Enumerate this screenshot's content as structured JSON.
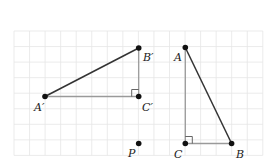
{
  "diagram": {
    "type": "geometry-grid",
    "grid": {
      "x0": 14,
      "y0": 31,
      "cell": 15.55,
      "cols": 16,
      "rows": 8,
      "color": "#e6e6e6"
    },
    "colors": {
      "leg": "#9a9a9a",
      "hypotenuse": "#333333",
      "point": "#111111",
      "right_angle": "#555555"
    },
    "points": {
      "A_prime": {
        "label": "A′",
        "x": 45,
        "y": 96.5,
        "lx": 34,
        "ly": 111
      },
      "B_prime": {
        "label": "B′",
        "x": 138.7,
        "y": 48,
        "lx": 143,
        "ly": 61
      },
      "C_prime": {
        "label": "C′",
        "x": 138.7,
        "y": 96.5,
        "lx": 142,
        "ly": 111
      },
      "P": {
        "label": "P",
        "x": 138.7,
        "y": 143.5,
        "lx": 128,
        "ly": 157
      },
      "A": {
        "label": "A",
        "x": 185.3,
        "y": 47.5,
        "lx": 174,
        "ly": 61
      },
      "B": {
        "label": "B",
        "x": 231.6,
        "y": 143.5,
        "lx": 236,
        "ly": 158
      },
      "C": {
        "label": "C",
        "x": 185.3,
        "y": 143.5,
        "lx": 174,
        "ly": 158
      }
    },
    "triangles": [
      {
        "name": "A'B'C'",
        "vertices": [
          "A′",
          "B′",
          "C′"
        ],
        "right_angle_at": "C′"
      },
      {
        "name": "ABC",
        "vertices": [
          "A",
          "B",
          "C"
        ],
        "right_angle_at": "C"
      }
    ]
  }
}
